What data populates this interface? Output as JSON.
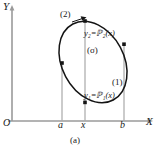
{
  "figure": {
    "caption": "(a)",
    "axes": {
      "y_label": "Y",
      "x_label": "X",
      "origin_label": "O"
    },
    "x_ticks": [
      {
        "id": "a",
        "label": "a"
      },
      {
        "id": "x",
        "label": "x"
      },
      {
        "id": "b",
        "label": "b"
      }
    ],
    "callouts": [
      {
        "id": "upper-arc",
        "label": "(2)"
      },
      {
        "id": "lower-arc",
        "label": "(1)"
      }
    ],
    "region": {
      "label": "(σ)"
    },
    "curves": [
      {
        "id": "upper",
        "equation": "y₂=ℙ₂(x)",
        "var": "y",
        "sub": "2",
        "rhs_function": "ℋ",
        "rhs_sub": "2",
        "arg": "(x)"
      },
      {
        "id": "lower",
        "equation": "y₁=ℙ₁(x)",
        "var": "y",
        "sub": "1",
        "rhs_function": "ℋ",
        "rhs_sub": "1",
        "arg": "(x)"
      }
    ],
    "colors": {
      "ink": "#1a1a1a",
      "curve": "#111111",
      "axis": "#999999",
      "guide": "#aaaaaa",
      "background": "#ffffff"
    }
  }
}
